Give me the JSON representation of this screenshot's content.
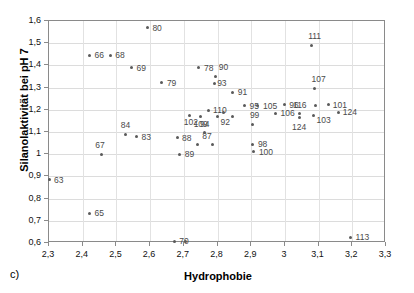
{
  "caption": "c)",
  "chart_data": {
    "type": "scatter",
    "title": "",
    "xlabel": "Hydrophobie",
    "ylabel": "Silanolaktivität bei pH 7",
    "xlim": [
      2.3,
      3.3
    ],
    "ylim": [
      0.6,
      1.6
    ],
    "xticks": [
      "2,3",
      "2,4",
      "2,5",
      "2,6",
      "2,7",
      "2,8",
      "2,9",
      "3",
      "3,1",
      "3,2",
      "3,3"
    ],
    "xtick_values": [
      2.3,
      2.4,
      2.5,
      2.6,
      2.7,
      2.8,
      2.9,
      3.0,
      3.1,
      3.2,
      3.3
    ],
    "yticks": [
      "0,6",
      "0,7",
      "0,8",
      "0,9",
      "1",
      "1,1",
      "1,2",
      "1,3",
      "1,4",
      "1,5",
      "1,6"
    ],
    "ytick_values": [
      0.6,
      0.7,
      0.8,
      0.9,
      1.0,
      1.1,
      1.2,
      1.3,
      1.4,
      1.5,
      1.6
    ],
    "grid": true,
    "legend": "none",
    "marker_color": "#5a5a5a",
    "label_color": "#4a4a4a",
    "frame_color": "#8a8a8a",
    "grid_color": "#dcdcdc",
    "points": [
      {
        "label": "63",
        "x": 2.3,
        "y": 0.885,
        "lx": 5,
        "ly": -4
      },
      {
        "label": "65",
        "x": 2.42,
        "y": 0.735,
        "lx": 5,
        "ly": -4
      },
      {
        "label": "66",
        "x": 2.42,
        "y": 1.445,
        "lx": 5,
        "ly": -4
      },
      {
        "label": "68",
        "x": 2.482,
        "y": 1.445,
        "lx": 5,
        "ly": -4
      },
      {
        "label": "67",
        "x": 2.455,
        "y": 1.0,
        "lx": -6,
        "ly": -13
      },
      {
        "label": "69",
        "x": 2.545,
        "y": 1.39,
        "lx": 5,
        "ly": -4
      },
      {
        "label": "70",
        "x": 2.672,
        "y": 0.608,
        "lx": 5,
        "ly": -4
      },
      {
        "label": "70b",
        "x": 2.706,
        "y": 0.605,
        "lx": 900,
        "ly": 900
      },
      {
        "label": "78",
        "x": 2.745,
        "y": 1.39,
        "lx": 5,
        "ly": -4
      },
      {
        "label": "79",
        "x": 2.635,
        "y": 1.322,
        "lx": 5,
        "ly": -4
      },
      {
        "label": "80",
        "x": 2.592,
        "y": 1.57,
        "lx": 5,
        "ly": -4
      },
      {
        "label": "83",
        "x": 2.56,
        "y": 1.078,
        "lx": 5,
        "ly": -4
      },
      {
        "label": "84",
        "x": 2.528,
        "y": 1.09,
        "lx": -5,
        "ly": -13
      },
      {
        "label": "88",
        "x": 2.68,
        "y": 1.075,
        "lx": 5,
        "ly": -4
      },
      {
        "label": "89",
        "x": 2.688,
        "y": 1.0,
        "lx": 5,
        "ly": -4
      },
      {
        "label": "87",
        "x": 2.74,
        "y": 1.045,
        "lx": 5,
        "ly": -12
      },
      {
        "label": "87b",
        "x": 2.785,
        "y": 1.042,
        "lx": 900,
        "ly": 900
      },
      {
        "label": "90",
        "x": 2.795,
        "y": 1.352,
        "lx": 3,
        "ly": -13
      },
      {
        "label": "93",
        "x": 2.79,
        "y": 1.32,
        "lx": 3,
        "ly": -4
      },
      {
        "label": "91",
        "x": 2.845,
        "y": 1.278,
        "lx": 5,
        "ly": -4
      },
      {
        "label": "94",
        "x": 2.76,
        "y": 1.098,
        "lx": -4,
        "ly": -12
      },
      {
        "label": "95",
        "x": 2.88,
        "y": 1.218,
        "lx": 5,
        "ly": -4
      },
      {
        "label": "105",
        "x": 2.92,
        "y": 1.218,
        "lx": 5,
        "ly": -4
      },
      {
        "label": "110",
        "x": 2.772,
        "y": 1.198,
        "lx": 5,
        "ly": -4
      },
      {
        "label": "102",
        "x": 2.718,
        "y": 1.175,
        "lx": -6,
        "ly": 3
      },
      {
        "label": "109",
        "x": 2.75,
        "y": 1.168,
        "lx": -7,
        "ly": 3
      },
      {
        "label": "92",
        "x": 2.8,
        "y": 1.17,
        "lx": 3,
        "ly": 2
      },
      {
        "label": "95b",
        "x": 2.818,
        "y": 1.19,
        "lx": 900,
        "ly": 900
      },
      {
        "label": "110b",
        "x": 2.845,
        "y": 1.168,
        "lx": 900,
        "ly": 900
      },
      {
        "label": "96",
        "x": 2.998,
        "y": 1.222,
        "lx": 5,
        "ly": -4
      },
      {
        "label": "106",
        "x": 2.972,
        "y": 1.185,
        "lx": 5,
        "ly": -4
      },
      {
        "label": "99",
        "x": 2.905,
        "y": 1.135,
        "lx": -3,
        "ly": -13
      },
      {
        "label": "98",
        "x": 2.905,
        "y": 1.045,
        "lx": 5,
        "ly": -4
      },
      {
        "label": "100",
        "x": 2.908,
        "y": 1.01,
        "lx": 5,
        "ly": -4
      },
      {
        "label": "111",
        "x": 3.078,
        "y": 1.49,
        "lx": -3,
        "ly": -13
      },
      {
        "label": "107",
        "x": 3.088,
        "y": 1.298,
        "lx": -3,
        "ly": -13
      },
      {
        "label": "116",
        "x": 3.042,
        "y": 1.182,
        "lx": -6,
        "ly": -13
      },
      {
        "label": "124",
        "x": 3.042,
        "y": 1.165,
        "lx": -7,
        "ly": 5
      },
      {
        "label": "103",
        "x": 3.085,
        "y": 1.175,
        "lx": 3,
        "ly": 1
      },
      {
        "label": "107b",
        "x": 3.09,
        "y": 1.218,
        "lx": 900,
        "ly": 900
      },
      {
        "label": "101",
        "x": 3.13,
        "y": 1.222,
        "lx": 4,
        "ly": -4
      },
      {
        "label": "124b",
        "x": 3.16,
        "y": 1.188,
        "lx": 4,
        "ly": -4
      },
      {
        "label": "113",
        "x": 3.195,
        "y": 0.625,
        "lx": 5,
        "ly": -4
      }
    ],
    "label_overrides": {
      "107b": "107",
      "124b": "124",
      "95b": "95",
      "110b": "110",
      "70b": "",
      "87b": ""
    }
  }
}
